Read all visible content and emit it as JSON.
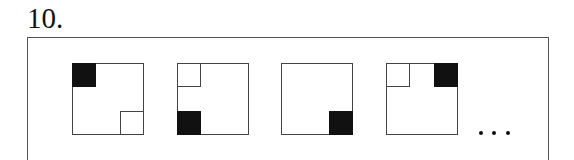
{
  "problem": {
    "number_label": "10.",
    "continuation": "...",
    "colors": {
      "filled": "#111111",
      "outline": "#444444",
      "background": "#ffffff"
    },
    "panels": [
      {
        "index": 1,
        "left": 72,
        "cells": [
          {
            "position": "tl",
            "fill": "filled"
          },
          {
            "position": "br",
            "fill": "empty"
          }
        ]
      },
      {
        "index": 2,
        "left": 177,
        "cells": [
          {
            "position": "tl",
            "fill": "empty"
          },
          {
            "position": "bl",
            "fill": "filled"
          }
        ]
      },
      {
        "index": 3,
        "left": 281,
        "cells": [
          {
            "position": "br",
            "fill": "filled"
          }
        ]
      },
      {
        "index": 4,
        "left": 386,
        "cells": [
          {
            "position": "tl",
            "fill": "empty"
          },
          {
            "position": "tr",
            "fill": "filled"
          }
        ]
      }
    ]
  }
}
